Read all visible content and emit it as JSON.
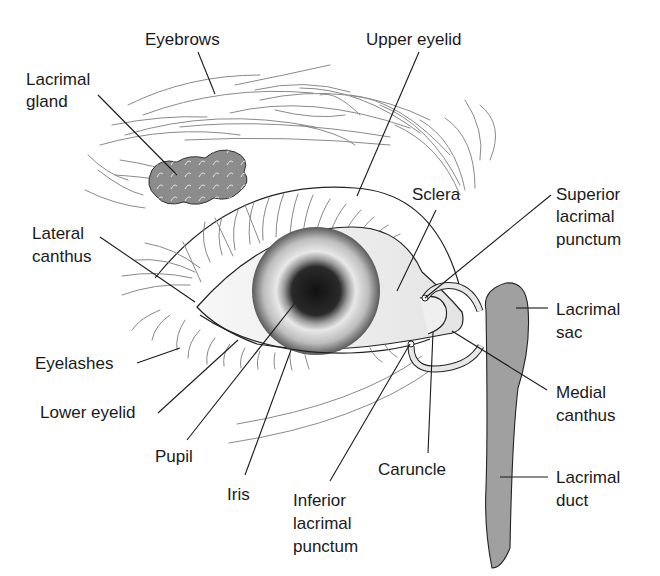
{
  "diagram": {
    "labels": {
      "eyebrows": "Eyebrows",
      "upper_eyelid": "Upper eyelid",
      "lacrimal_gland_1": "Lacrimal",
      "lacrimal_gland_2": "gland",
      "sclera": "Sclera",
      "superior_punctum_1": "Superior",
      "superior_punctum_2": "lacrimal",
      "superior_punctum_3": "punctum",
      "lateral_canthus_1": "Lateral",
      "lateral_canthus_2": "canthus",
      "lacrimal_sac_1": "Lacrimal",
      "lacrimal_sac_2": "sac",
      "eyelashes": "Eyelashes",
      "medial_canthus_1": "Medial",
      "medial_canthus_2": "canthus",
      "lower_eyelid": "Lower eyelid",
      "pupil": "Pupil",
      "caruncle": "Caruncle",
      "lacrimal_duct_1": "Lacrimal",
      "lacrimal_duct_2": "duct",
      "iris": "Iris",
      "inferior_punctum_1": "Inferior",
      "inferior_punctum_2": "lacrimal",
      "inferior_punctum_3": "punctum"
    },
    "colors": {
      "gland_fill": "#8c8c8c",
      "sac_fill": "#a0a0a0",
      "line": "#1a1a1a",
      "hair": "#8a8a8a"
    }
  }
}
